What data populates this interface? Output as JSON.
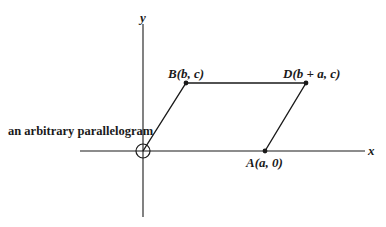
{
  "caption": "an arbitrary parallelogram",
  "axes": {
    "x_label": "x",
    "y_label": "y"
  },
  "points": {
    "B": {
      "name": "B",
      "coords": "(b, c)"
    },
    "D": {
      "name": "D",
      "coords": "(b + a, c)"
    },
    "A": {
      "name": "A",
      "coords": "(a, 0)"
    },
    "O": {
      "name": "origin",
      "marker": "circle"
    }
  },
  "colors": {
    "line": "#1a1a1a",
    "background": "#ffffff"
  }
}
